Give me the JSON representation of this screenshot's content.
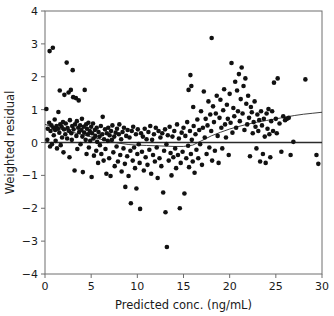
{
  "chart_data": {
    "type": "scatter",
    "title": "",
    "xlabel": "Predicted conc. (ng/mL)",
    "ylabel": "Weighted residual",
    "xlim": [
      0,
      30
    ],
    "ylim": [
      -4,
      4
    ],
    "xticks": [
      0,
      5,
      10,
      15,
      20,
      25,
      30
    ],
    "yticks": [
      4,
      3,
      2,
      1,
      0,
      -1,
      -2,
      -3,
      -4
    ],
    "xtick_labels": [
      "0",
      "5",
      "10",
      "15",
      "20",
      "25",
      "30"
    ],
    "ytick_labels": [
      "4",
      "3",
      "2",
      "1",
      "0",
      "−1",
      "−2",
      "−3",
      "−4"
    ],
    "grid": false,
    "legend": null,
    "marker": "filled-circle",
    "marker_color": "#111111",
    "marker_size_px": 4.6,
    "reference_lines": [
      {
        "name": "zero-line",
        "type": "horizontal",
        "y": 0,
        "color": "#2b2b2b"
      }
    ],
    "trend_line": {
      "name": "smoothed-trend",
      "type": "loess",
      "color": "#2b2b2b",
      "points": [
        [
          0.0,
          0.55
        ],
        [
          1.0,
          0.46
        ],
        [
          2.0,
          0.38
        ],
        [
          3.0,
          0.31
        ],
        [
          4.0,
          0.24
        ],
        [
          5.0,
          0.17
        ],
        [
          6.0,
          0.1
        ],
        [
          7.0,
          0.03
        ],
        [
          8.0,
          -0.02
        ],
        [
          9.0,
          -0.06
        ],
        [
          10.0,
          -0.08
        ],
        [
          11.0,
          -0.09
        ],
        [
          12.0,
          -0.1
        ],
        [
          13.0,
          -0.11
        ],
        [
          14.0,
          -0.12
        ],
        [
          15.0,
          -0.12
        ],
        [
          16.0,
          -0.08
        ],
        [
          17.0,
          0.06
        ],
        [
          18.0,
          0.2
        ],
        [
          19.0,
          0.31
        ],
        [
          20.0,
          0.41
        ],
        [
          21.0,
          0.49
        ],
        [
          22.0,
          0.56
        ],
        [
          23.0,
          0.62
        ],
        [
          24.0,
          0.67
        ],
        [
          25.0,
          0.72
        ],
        [
          26.0,
          0.77
        ],
        [
          27.0,
          0.82
        ],
        [
          28.0,
          0.86
        ],
        [
          29.0,
          0.89
        ],
        [
          30.0,
          0.92
        ]
      ]
    },
    "points": [
      [
        0.15,
        1.02
      ],
      [
        0.25,
        0.08
      ],
      [
        0.3,
        0.42
      ],
      [
        0.45,
        0.6
      ],
      [
        0.5,
        2.78
      ],
      [
        0.55,
        -0.12
      ],
      [
        0.6,
        0.35
      ],
      [
        0.7,
        0.52
      ],
      [
        0.75,
        -0.05
      ],
      [
        0.85,
        2.88
      ],
      [
        0.9,
        0.45
      ],
      [
        0.95,
        0.22
      ],
      [
        1.05,
        0.7
      ],
      [
        1.1,
        0.38
      ],
      [
        1.15,
        0.05
      ],
      [
        1.25,
        0.5
      ],
      [
        1.3,
        -0.18
      ],
      [
        1.4,
        0.42
      ],
      [
        1.45,
        0.93
      ],
      [
        1.55,
        0.3
      ],
      [
        1.6,
        1.58
      ],
      [
        1.65,
        0.55
      ],
      [
        1.7,
        -0.08
      ],
      [
        1.8,
        0.48
      ],
      [
        1.85,
        0.15
      ],
      [
        1.95,
        0.62
      ],
      [
        2.0,
        -0.3
      ],
      [
        2.05,
        0.4
      ],
      [
        2.1,
        1.45
      ],
      [
        2.2,
        0.25
      ],
      [
        2.25,
        0.58
      ],
      [
        2.35,
        2.43
      ],
      [
        2.4,
        0.12
      ],
      [
        2.45,
        0.44
      ],
      [
        2.55,
        1.52
      ],
      [
        2.6,
        0.35
      ],
      [
        2.65,
        -0.45
      ],
      [
        2.7,
        0.68
      ],
      [
        2.8,
        1.6
      ],
      [
        2.85,
        0.28
      ],
      [
        2.9,
        0.08
      ],
      [
        2.95,
        0.5
      ],
      [
        3.0,
        2.2
      ],
      [
        3.05,
        1.38
      ],
      [
        3.1,
        0.4
      ],
      [
        3.2,
        -0.85
      ],
      [
        3.25,
        0.55
      ],
      [
        3.35,
        1.35
      ],
      [
        3.4,
        0.2
      ],
      [
        3.45,
        0.65
      ],
      [
        3.5,
        -0.2
      ],
      [
        3.6,
        0.45
      ],
      [
        3.65,
        1.28
      ],
      [
        3.7,
        0.32
      ],
      [
        3.8,
        0.52
      ],
      [
        3.85,
        -0.05
      ],
      [
        3.95,
        0.38
      ],
      [
        4.0,
        0.72
      ],
      [
        4.05,
        0.18
      ],
      [
        4.1,
        -0.9
      ],
      [
        4.2,
        0.48
      ],
      [
        4.25,
        0.3
      ],
      [
        4.3,
        1.6
      ],
      [
        4.4,
        0.08
      ],
      [
        4.45,
        0.55
      ],
      [
        4.5,
        -0.35
      ],
      [
        4.55,
        0.42
      ],
      [
        4.65,
        0.25
      ],
      [
        4.7,
        0.6
      ],
      [
        4.75,
        -0.15
      ],
      [
        4.85,
        0.35
      ],
      [
        4.9,
        0.05
      ],
      [
        5.0,
        0.48
      ],
      [
        5.05,
        -1.05
      ],
      [
        5.1,
        0.28
      ],
      [
        5.2,
        0.58
      ],
      [
        5.25,
        0.12
      ],
      [
        5.3,
        -0.4
      ],
      [
        5.4,
        0.38
      ],
      [
        5.45,
        0.2
      ],
      [
        5.55,
        -0.25
      ],
      [
        5.6,
        0.45
      ],
      [
        5.65,
        0.02
      ],
      [
        5.75,
        -0.62
      ],
      [
        5.8,
        0.32
      ],
      [
        5.9,
        0.18
      ],
      [
        5.95,
        -0.08
      ],
      [
        6.05,
        0.5
      ],
      [
        6.1,
        -0.35
      ],
      [
        6.2,
        0.25
      ],
      [
        6.25,
        0.78
      ],
      [
        6.35,
        -0.55
      ],
      [
        6.4,
        0.1
      ],
      [
        6.5,
        0.4
      ],
      [
        6.55,
        -0.2
      ],
      [
        6.65,
        -0.95
      ],
      [
        6.7,
        0.28
      ],
      [
        6.8,
        0.05
      ],
      [
        6.85,
        0.45
      ],
      [
        6.95,
        -0.48
      ],
      [
        7.0,
        0.22
      ],
      [
        7.1,
        -1.02
      ],
      [
        7.15,
        0.35
      ],
      [
        7.25,
        0.08
      ],
      [
        7.3,
        0.52
      ],
      [
        7.4,
        -0.3
      ],
      [
        7.5,
        0.18
      ],
      [
        7.55,
        -0.72
      ],
      [
        7.65,
        0.3
      ],
      [
        7.75,
        -0.12
      ],
      [
        7.8,
        0.42
      ],
      [
        7.9,
        -0.58
      ],
      [
        8.0,
        0.25
      ],
      [
        8.05,
        0.55
      ],
      [
        8.15,
        -0.38
      ],
      [
        8.25,
        0.1
      ],
      [
        8.3,
        -0.88
      ],
      [
        8.4,
        0.32
      ],
      [
        8.5,
        -0.18
      ],
      [
        8.55,
        0.45
      ],
      [
        8.65,
        -0.65
      ],
      [
        8.7,
        -1.35
      ],
      [
        8.8,
        0.2
      ],
      [
        8.9,
        -0.42
      ],
      [
        8.95,
        0.38
      ],
      [
        9.05,
        -1.02
      ],
      [
        9.15,
        0.15
      ],
      [
        9.25,
        -0.25
      ],
      [
        9.3,
        -1.85
      ],
      [
        9.4,
        0.35
      ],
      [
        9.5,
        -0.55
      ],
      [
        9.55,
        0.48
      ],
      [
        9.65,
        -0.15
      ],
      [
        9.75,
        -0.78
      ],
      [
        9.85,
        0.25
      ],
      [
        9.9,
        -1.4
      ],
      [
        10.0,
        -0.35
      ],
      [
        10.05,
        0.4
      ],
      [
        10.15,
        -0.05
      ],
      [
        10.25,
        -0.62
      ],
      [
        10.3,
        -2.02
      ],
      [
        10.4,
        0.28
      ],
      [
        10.5,
        -0.28
      ],
      [
        10.6,
        0.18
      ],
      [
        10.7,
        -0.85
      ],
      [
        10.8,
        0.42
      ],
      [
        10.9,
        -0.45
      ],
      [
        11.0,
        0.1
      ],
      [
        11.1,
        -0.68
      ],
      [
        11.2,
        0.32
      ],
      [
        11.3,
        -0.22
      ],
      [
        11.4,
        0.5
      ],
      [
        11.5,
        -0.95
      ],
      [
        11.6,
        0.08
      ],
      [
        11.7,
        -0.38
      ],
      [
        11.8,
        0.25
      ],
      [
        11.9,
        -0.58
      ],
      [
        12.0,
        0.45
      ],
      [
        12.1,
        -0.15
      ],
      [
        12.2,
        -1.08
      ],
      [
        12.3,
        0.35
      ],
      [
        12.4,
        -0.48
      ],
      [
        12.5,
        0.15
      ],
      [
        12.6,
        -0.72
      ],
      [
        12.7,
        0.28
      ],
      [
        12.8,
        -1.52
      ],
      [
        12.9,
        -0.25
      ],
      [
        13.0,
        0.4
      ],
      [
        13.05,
        -2.12
      ],
      [
        13.15,
        -0.05
      ],
      [
        13.2,
        -3.18
      ],
      [
        13.3,
        0.22
      ],
      [
        13.4,
        -0.55
      ],
      [
        13.5,
        0.48
      ],
      [
        13.6,
        -0.32
      ],
      [
        13.7,
        -1.0
      ],
      [
        13.8,
        0.18
      ],
      [
        13.9,
        -0.45
      ],
      [
        14.0,
        0.35
      ],
      [
        14.1,
        -0.18
      ],
      [
        14.2,
        -0.78
      ],
      [
        14.3,
        0.55
      ],
      [
        14.4,
        -0.38
      ],
      [
        14.5,
        0.12
      ],
      [
        14.6,
        -2.0
      ],
      [
        14.7,
        -0.62
      ],
      [
        14.8,
        0.3
      ],
      [
        14.9,
        -0.28
      ],
      [
        15.0,
        0.45
      ],
      [
        15.1,
        -1.55
      ],
      [
        15.2,
        0.2
      ],
      [
        15.3,
        -0.48
      ],
      [
        15.4,
        0.62
      ],
      [
        15.5,
        -0.1
      ],
      [
        15.55,
        1.6
      ],
      [
        15.6,
        -0.75
      ],
      [
        15.7,
        0.35
      ],
      [
        15.75,
        2.05
      ],
      [
        15.8,
        -0.35
      ],
      [
        15.85,
        1.72
      ],
      [
        15.9,
        0.08
      ],
      [
        16.0,
        -0.58
      ],
      [
        16.05,
        1.08
      ],
      [
        16.1,
        0.5
      ],
      [
        16.2,
        -0.92
      ],
      [
        16.3,
        0.25
      ],
      [
        16.4,
        -0.22
      ],
      [
        16.5,
        0.7
      ],
      [
        16.6,
        -0.48
      ],
      [
        16.7,
        0.38
      ],
      [
        16.8,
        -0.05
      ],
      [
        16.9,
        0.95
      ],
      [
        17.0,
        -0.68
      ],
      [
        17.1,
        0.45
      ],
      [
        17.2,
        1.55
      ],
      [
        17.3,
        0.15
      ],
      [
        17.4,
        0.72
      ],
      [
        17.5,
        -0.35
      ],
      [
        17.6,
        0.52
      ],
      [
        17.7,
        1.25
      ],
      [
        17.8,
        -0.15
      ],
      [
        17.9,
        0.85
      ],
      [
        18.0,
        0.35
      ],
      [
        18.05,
        3.18
      ],
      [
        18.1,
        -0.55
      ],
      [
        18.2,
        1.1
      ],
      [
        18.3,
        0.62
      ],
      [
        18.4,
        -0.25
      ],
      [
        18.5,
        0.88
      ],
      [
        18.6,
        1.42
      ],
      [
        18.7,
        0.2
      ],
      [
        18.8,
        -0.62
      ],
      [
        18.9,
        0.75
      ],
      [
        19.0,
        1.3
      ],
      [
        19.1,
        0.45
      ],
      [
        19.2,
        -0.18
      ],
      [
        19.3,
        0.98
      ],
      [
        19.4,
        1.62
      ],
      [
        19.5,
        0.55
      ],
      [
        19.6,
        0.15
      ],
      [
        19.7,
        1.15
      ],
      [
        19.8,
        0.72
      ],
      [
        19.9,
        -0.38
      ],
      [
        20.0,
        1.48
      ],
      [
        20.1,
        0.6
      ],
      [
        20.2,
        2.42
      ],
      [
        20.3,
        0.3
      ],
      [
        20.4,
        1.05
      ],
      [
        20.5,
        0.8
      ],
      [
        20.6,
        1.85
      ],
      [
        20.7,
        0.45
      ],
      [
        20.8,
        1.58
      ],
      [
        20.9,
        0.95
      ],
      [
        21.0,
        2.08
      ],
      [
        21.1,
        0.65
      ],
      [
        21.2,
        1.32
      ],
      [
        21.3,
        2.28
      ],
      [
        21.4,
        0.88
      ],
      [
        21.5,
        1.72
      ],
      [
        21.6,
        0.38
      ],
      [
        21.7,
        1.95
      ],
      [
        21.8,
        1.18
      ],
      [
        21.9,
        0.55
      ],
      [
        22.0,
        1.42
      ],
      [
        22.1,
        0.75
      ],
      [
        22.2,
        -0.42
      ],
      [
        22.3,
        1.08
      ],
      [
        22.4,
        0.92
      ],
      [
        22.5,
        0.28
      ],
      [
        22.6,
        0.62
      ],
      [
        22.7,
        1.25
      ],
      [
        22.8,
        0.48
      ],
      [
        22.9,
        -0.18
      ],
      [
        23.0,
        0.85
      ],
      [
        23.1,
        0.35
      ],
      [
        23.2,
        0.68
      ],
      [
        23.3,
        -0.58
      ],
      [
        23.4,
        0.95
      ],
      [
        23.5,
        0.52
      ],
      [
        23.6,
        -0.35
      ],
      [
        23.7,
        0.72
      ],
      [
        23.8,
        0.18
      ],
      [
        23.9,
        -0.62
      ],
      [
        24.0,
        0.88
      ],
      [
        24.1,
        0.42
      ],
      [
        24.2,
        1.02
      ],
      [
        24.3,
        0.25
      ],
      [
        24.4,
        -0.45
      ],
      [
        24.5,
        0.65
      ],
      [
        24.6,
        0.95
      ],
      [
        24.7,
        0.35
      ],
      [
        24.8,
        1.82
      ],
      [
        25.0,
        0.72
      ],
      [
        25.1,
        0.28
      ],
      [
        25.2,
        1.95
      ],
      [
        25.4,
        0.58
      ],
      [
        25.6,
        -0.28
      ],
      [
        25.8,
        0.8
      ],
      [
        26.0,
        0.68
      ],
      [
        26.2,
        0.72
      ],
      [
        26.4,
        0.75
      ],
      [
        26.6,
        -0.38
      ],
      [
        26.9,
        0.02
      ],
      [
        28.2,
        1.92
      ],
      [
        29.4,
        -0.38
      ],
      [
        29.6,
        -0.65
      ]
    ]
  }
}
